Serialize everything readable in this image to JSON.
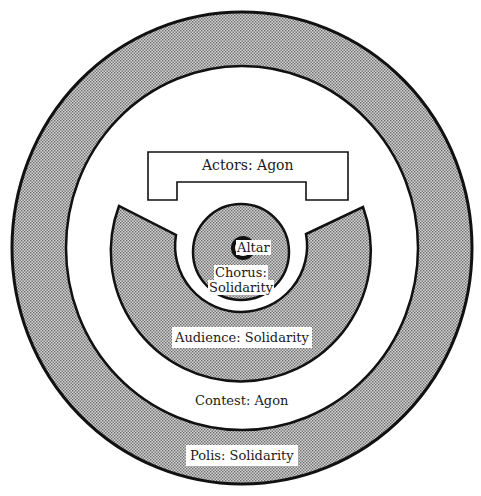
{
  "diagram": {
    "type": "concentric-ring-diagram",
    "colors": {
      "stroke": "#111111",
      "stipple_fill": "#b8b8b8",
      "background": "#ffffff"
    },
    "labels": {
      "actors": "Actors: Agon",
      "altar": "Altar",
      "chorus_line1": "Chorus:",
      "chorus_line2": "Solidarity",
      "audience": "Audience: Solidarity",
      "contest": "Contest: Agon",
      "polis": "Polis: Solidarity"
    },
    "regions": [
      {
        "name": "Polis",
        "role": "Solidarity",
        "shape": "outer ring",
        "shaded": true
      },
      {
        "name": "Contest",
        "role": "Agon",
        "shape": "white ring",
        "shaded": false
      },
      {
        "name": "Actors",
        "role": "Agon",
        "shape": "stage outline",
        "shaded": false
      },
      {
        "name": "Audience",
        "role": "Solidarity",
        "shape": "horseshoe arc",
        "shaded": true
      },
      {
        "name": "Chorus",
        "role": "Solidarity",
        "shape": "inner circle",
        "shaded": true
      },
      {
        "name": "Altar",
        "role": "",
        "shape": "center ring",
        "shaded": false
      }
    ]
  }
}
